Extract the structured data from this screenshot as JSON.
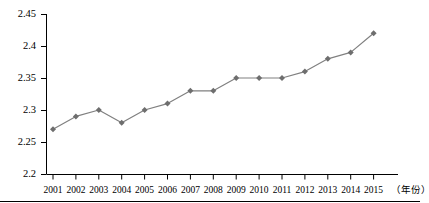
{
  "chart_data": {
    "type": "line",
    "title": "",
    "subtitle": "",
    "xlabel": "（年份）",
    "ylabel": "",
    "categories": [
      "2001",
      "2002",
      "2003",
      "2004",
      "2005",
      "2006",
      "2007",
      "2008",
      "2009",
      "2010",
      "2011",
      "2012",
      "2013",
      "2014",
      "2015"
    ],
    "values": [
      2.27,
      2.29,
      2.3,
      2.28,
      2.3,
      2.31,
      2.33,
      2.33,
      2.35,
      2.35,
      2.35,
      2.36,
      2.38,
      2.39,
      2.42
    ],
    "series": [
      {
        "name": "",
        "values": [
          2.27,
          2.29,
          2.3,
          2.28,
          2.3,
          2.31,
          2.33,
          2.33,
          2.35,
          2.35,
          2.35,
          2.36,
          2.38,
          2.39,
          2.42
        ]
      }
    ],
    "ylim": [
      2.2,
      2.45
    ],
    "yticks": [
      "2.2",
      "2.25",
      "2.3",
      "2.35",
      "2.4",
      "2.45"
    ],
    "ytick_values": [
      2.2,
      2.25,
      2.3,
      2.35,
      2.4,
      2.45
    ],
    "grid": false,
    "legend": false,
    "legend_position": "none",
    "marker": "diamond",
    "line_color": "#808080",
    "marker_color": "#6e6e6e",
    "axis_color": "#000000"
  }
}
